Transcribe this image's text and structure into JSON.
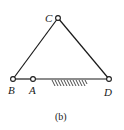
{
  "figure": {
    "caption": "(b)",
    "colors": {
      "stroke": "#1a1a1a",
      "background": "#ffffff"
    },
    "points": {
      "C": {
        "label": "C",
        "x": 58,
        "y": 18
      },
      "B": {
        "label": "B",
        "x": 13,
        "y": 79
      },
      "A": {
        "label": "A",
        "x": 33,
        "y": 79
      },
      "D": {
        "label": "D",
        "x": 109,
        "y": 79
      }
    },
    "links": [
      {
        "from": "B",
        "to": "C"
      },
      {
        "from": "C",
        "to": "D"
      },
      {
        "from": "B",
        "to": "A"
      },
      {
        "from": "A",
        "to": "D"
      }
    ],
    "ground": {
      "label": "fixed-ground-hatching",
      "x_start": 52,
      "x_end": 87,
      "y": 80
    }
  }
}
